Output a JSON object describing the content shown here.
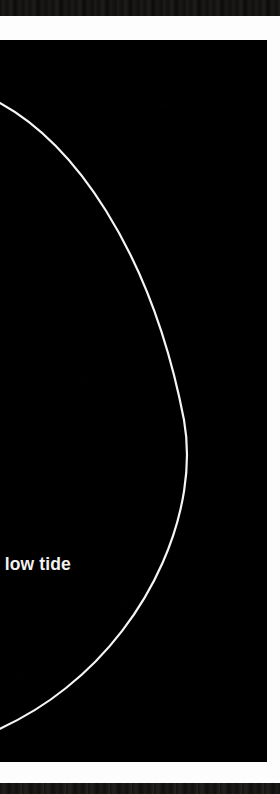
{
  "page": {
    "background_color": "#ffffff",
    "panel_color": "#000000",
    "ink_color": "#f2f2f2",
    "width": 280,
    "height": 794
  },
  "top_edge": {
    "name": "cropped-page-edge-top",
    "color": "#141414"
  },
  "bottom_edge": {
    "name": "cropped-page-edge-bottom",
    "color": "#141414"
  },
  "gutter": {
    "color": "#fdfdfd"
  },
  "figure": {
    "label": "tide-curve-diagram",
    "arc": {
      "name": "tide-curve-arc",
      "color": "#f5f5f5",
      "stroke_width": 2.2,
      "entry_point": [
        0,
        66
      ],
      "apex_point": [
        184,
        380
      ],
      "exit_point": [
        0,
        663
      ]
    },
    "caption": {
      "text": "r low tide",
      "visible_text": "low tide",
      "color": "#f2f2f2",
      "weight": "bold",
      "clipped_left": true
    }
  }
}
